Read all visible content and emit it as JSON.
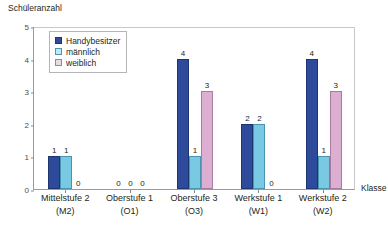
{
  "chart_data": {
    "type": "bar",
    "title": "",
    "ylabel": "Schüleranzahl",
    "xlabel": "Klasse",
    "ylim": [
      0,
      5
    ],
    "yticks": [
      "0",
      "1",
      "2",
      "3",
      "4",
      "5"
    ],
    "grid": false,
    "legend_position": "top-left-inside",
    "categories": [
      "Mittelstufe 2",
      "Oberstufe 1",
      "Oberstufe 3",
      "Werkstufe 1",
      "Werkstufe 2"
    ],
    "category_codes": [
      "(M2)",
      "(O1)",
      "(O3)",
      "(W1)",
      "(W2)"
    ],
    "series": [
      {
        "name": "Handybesitzer",
        "color": "#2e4b9b",
        "values": [
          1,
          0,
          4,
          2,
          4
        ]
      },
      {
        "name": "männlich",
        "color": "#79c9e3",
        "values": [
          1,
          0,
          1,
          2,
          1
        ]
      },
      {
        "name": "weiblich",
        "color": "#dcaed2",
        "values": [
          0,
          0,
          3,
          0,
          3
        ]
      }
    ]
  }
}
